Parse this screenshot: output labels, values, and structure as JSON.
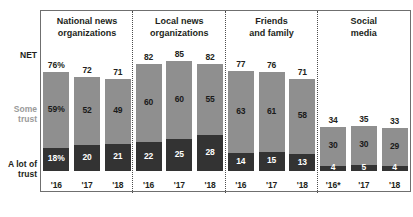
{
  "axis_labels": {
    "net": "NET",
    "some": "Some\ntrust",
    "alot": "A lot of\ntrust"
  },
  "chart_data": {
    "type": "bar",
    "title": "",
    "subtitle": "",
    "xlabel": "",
    "ylabel": "",
    "ylim": [
      0,
      100
    ],
    "grid": false,
    "legend_position": "left-axis",
    "stacked": true,
    "series": [
      {
        "name": "A lot of trust",
        "color": "#333333"
      },
      {
        "name": "Some trust",
        "color": "#8f8f8f"
      }
    ],
    "net_label": "NET",
    "panels": [
      {
        "name": "National news organizations",
        "header": "National news\norganizations",
        "categories": [
          "'16",
          "'17",
          "'18"
        ],
        "net": [
          "76%",
          "72",
          "71"
        ],
        "net_values": [
          76,
          72,
          71
        ],
        "some": [
          "59%",
          "52",
          "49"
        ],
        "some_values": [
          59,
          52,
          49
        ],
        "alot": [
          "18%",
          "20",
          "21"
        ],
        "alot_values": [
          18,
          20,
          21
        ]
      },
      {
        "name": "Local news organizations",
        "header": "Local news\norganizations",
        "categories": [
          "'16",
          "'17",
          "'18"
        ],
        "net": [
          "82",
          "85",
          "82"
        ],
        "net_values": [
          82,
          85,
          82
        ],
        "some": [
          "60",
          "60",
          "55"
        ],
        "some_values": [
          60,
          60,
          55
        ],
        "alot": [
          "22",
          "25",
          "28"
        ],
        "alot_values": [
          22,
          25,
          28
        ]
      },
      {
        "name": "Friends and family",
        "header": "Friends\nand family",
        "categories": [
          "'16",
          "'17",
          "'18"
        ],
        "net": [
          "77",
          "76",
          "71"
        ],
        "net_values": [
          77,
          76,
          71
        ],
        "some": [
          "63",
          "61",
          "58"
        ],
        "some_values": [
          63,
          61,
          58
        ],
        "alot": [
          "14",
          "15",
          "13"
        ],
        "alot_values": [
          14,
          15,
          13
        ]
      },
      {
        "name": "Social media",
        "header": "Social\nmedia",
        "categories": [
          "'16*",
          "'17",
          "'18"
        ],
        "net": [
          "34",
          "35",
          "33"
        ],
        "net_values": [
          34,
          35,
          33
        ],
        "some": [
          "30",
          "30",
          "29"
        ],
        "some_values": [
          30,
          30,
          29
        ],
        "alot": [
          "4",
          "5",
          "4"
        ],
        "alot_values": [
          4,
          5,
          4
        ]
      }
    ]
  }
}
